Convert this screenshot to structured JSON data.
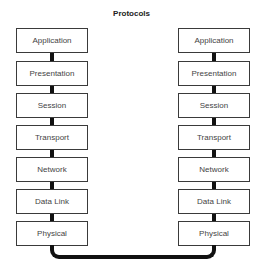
{
  "title": "Protocols",
  "left_stack": {
    "layers": [
      "Application",
      "Presentation",
      "Session",
      "Transport",
      "Network",
      "Data Link",
      "Physical"
    ]
  },
  "right_stack": {
    "layers": [
      "Application",
      "Presentation",
      "Session",
      "Transport",
      "Network",
      "Data Link",
      "Physical"
    ]
  },
  "colors": {
    "box_border": "#3a3a3a",
    "connector": "#111111",
    "text": "#444444"
  }
}
